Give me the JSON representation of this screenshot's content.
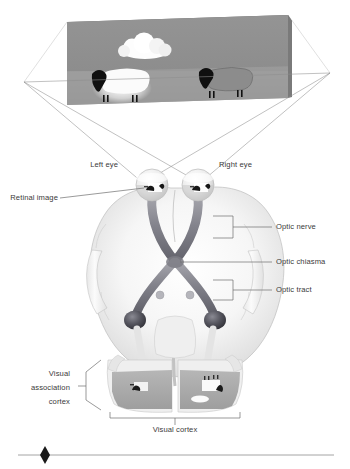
{
  "figure": {
    "background_color": "#ffffff"
  },
  "scene": {
    "name": "viewed scene panel",
    "panel_face_color": "#8f8f8f",
    "panel_top_color": "#6b6b6b",
    "ground_color": "#9a9a9a",
    "objects": [
      {
        "name": "cloud",
        "color": "#fdfdfd"
      },
      {
        "name": "sheep-white",
        "body_color": "#fafafa",
        "head_color": "#111111"
      },
      {
        "name": "sheep-gray",
        "body_color": "#8a8a8a",
        "head_color": "#111111"
      }
    ]
  },
  "projection": {
    "name": "light ray lines",
    "color": "#8d8d8d",
    "description": "crossing rays from scene edges to each eye"
  },
  "brain": {
    "name": "brain viewed from below",
    "fill_light": "#fbfbfb",
    "fill_shadow": "#d6d6d6",
    "outline": "#b4b4b4",
    "tract_color": "#8c8c93",
    "tract_dark": "#5d5d66",
    "lgn_color": "#4a4a52",
    "cortex_band": "#a9a9a9"
  },
  "labels": {
    "left_eye": "Left eye",
    "right_eye": "Right eye",
    "retinal_image": "Retinal image",
    "optic_nerve": "Optic nerve",
    "optic_chiasma": "Optic chiasma",
    "optic_tract": "Optic tract",
    "visual_association_cortex_line1": "Visual",
    "visual_association_cortex_line2": "association",
    "visual_association_cortex_line3": "cortex",
    "visual_cortex": "Visual cortex"
  },
  "footer": {
    "name": "page rule with diamond bullet",
    "rule_color": "#9a9a9a",
    "diamond_color": "#1a1a1a"
  }
}
